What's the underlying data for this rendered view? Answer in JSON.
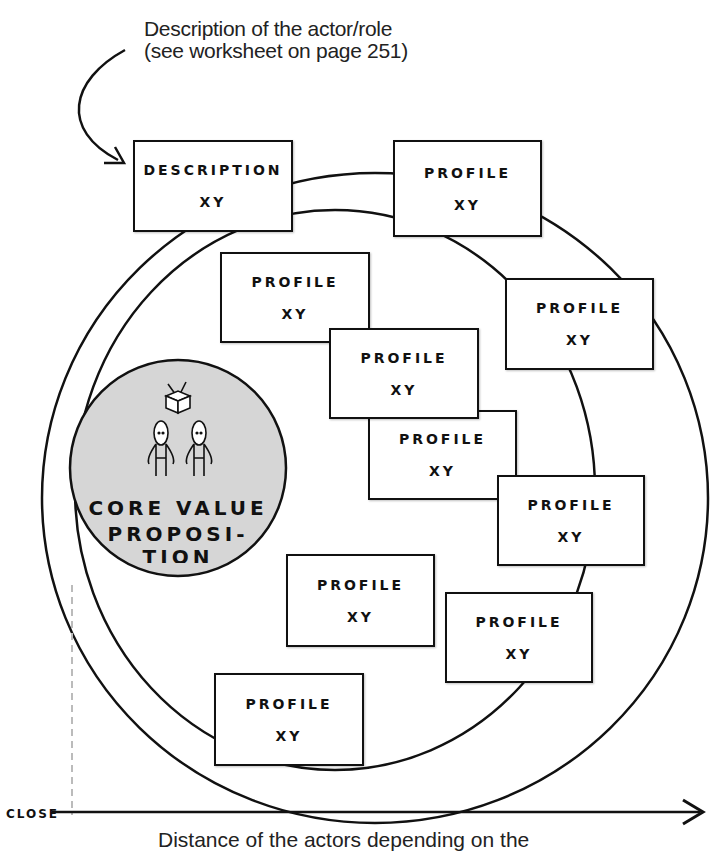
{
  "annotation": {
    "line1": "Description of the actor/role",
    "line2": "(see worksheet on page 251)"
  },
  "description_box": {
    "title": "DESCRIPTION",
    "subtitle": "XY"
  },
  "profiles": [
    {
      "title": "PROFILE",
      "subtitle": "XY"
    },
    {
      "title": "PROFILE",
      "subtitle": "XY"
    },
    {
      "title": "PROFILE",
      "subtitle": "XY"
    },
    {
      "title": "PROFILE",
      "subtitle": "XY"
    },
    {
      "title": "PROFILE",
      "subtitle": "XY"
    },
    {
      "title": "PROFILE",
      "subtitle": "XY"
    },
    {
      "title": "PROFILE",
      "subtitle": "XY"
    },
    {
      "title": "PROFILE",
      "subtitle": "XY"
    },
    {
      "title": "PROFILE",
      "subtitle": "XY"
    }
  ],
  "core": {
    "line1": "CORE VALUE",
    "line2": "PROPOSI-",
    "line3": "TION"
  },
  "axis": {
    "start_label": "CLOSE",
    "caption": "Distance of the actors depending on the"
  },
  "colors": {
    "core_fill": "#d6d6d6",
    "stroke": "#111111"
  }
}
